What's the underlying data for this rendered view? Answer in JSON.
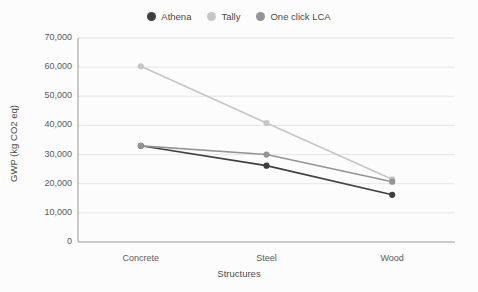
{
  "chart_data": {
    "type": "line",
    "title": "",
    "xlabel": "Structures",
    "ylabel": "GWP (kg CO2 eq)",
    "categories": [
      "Concrete",
      "Steel",
      "Wood"
    ],
    "series": [
      {
        "name": "Athena",
        "color": "#3f3f3f",
        "values": [
          33000,
          26200,
          16200
        ]
      },
      {
        "name": "Tally",
        "color": "#c6c6c6",
        "values": [
          60300,
          40800,
          21500
        ]
      },
      {
        "name": "One click LCA",
        "color": "#949494",
        "values": [
          33000,
          30000,
          20700
        ]
      }
    ],
    "ylim": [
      0,
      70000
    ],
    "ytick_values": [
      0,
      10000,
      20000,
      30000,
      40000,
      50000,
      60000,
      70000
    ],
    "ytick_labels": [
      "0",
      "10,000",
      "20,000",
      "30,000",
      "40,000",
      "50,000",
      "60,000",
      "70,000"
    ],
    "grid": true,
    "grid_color": "#e3e3e3",
    "axis_color": "#9a9a9a",
    "legend_position": "top-center",
    "background_color": "#fcfcfc",
    "marker": "circle"
  },
  "legend": {
    "items": [
      {
        "label": "Athena"
      },
      {
        "label": "Tally"
      },
      {
        "label": "One click LCA"
      }
    ]
  }
}
